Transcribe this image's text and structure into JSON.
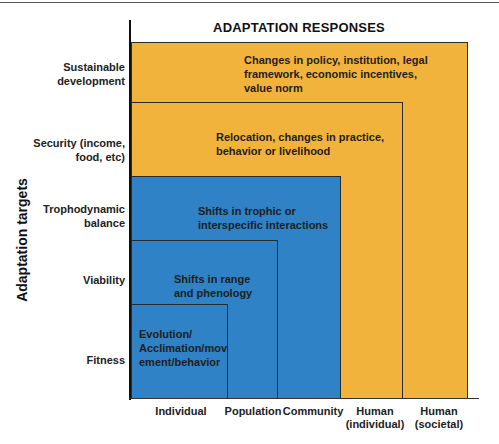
{
  "title": "ADAPTATION RESPONSES",
  "y_axis": {
    "title": "Adaptation targets",
    "labels": [
      {
        "line1": "Sustainable",
        "line2": "development"
      },
      {
        "line1": "Security (income,",
        "line2": "food, etc)"
      },
      {
        "line1": "Trophodynamic",
        "line2": "balance"
      },
      {
        "line1": "Viability",
        "line2": ""
      },
      {
        "line1": "Fitness",
        "line2": ""
      }
    ]
  },
  "x_axis": {
    "labels": [
      {
        "line1": "Individual",
        "line2": ""
      },
      {
        "line1": "Population",
        "line2": ""
      },
      {
        "line1": "Community",
        "line2": ""
      },
      {
        "line1": "Human",
        "line2": "(individual)"
      },
      {
        "line1": "Human",
        "line2": "(societal)"
      }
    ]
  },
  "boxes": [
    {
      "color": "#f2b33d",
      "lines": [
        "Changes in policy, institution, legal",
        "framework, economic incentives,",
        "value norm"
      ]
    },
    {
      "color": "#f2b33d",
      "lines": [
        "Relocation, changes in practice,",
        "behavior or livelihood"
      ]
    },
    {
      "color": "#2f82c5",
      "lines": [
        "Shifts in trophic or",
        "interspecific interactions"
      ]
    },
    {
      "color": "#2f82c5",
      "lines": [
        "Shifts in range",
        "and phenology"
      ]
    },
    {
      "color": "#2f82c5",
      "lines": [
        "Evolution/",
        "Acclimation/mov",
        "ement/behavior"
      ]
    }
  ],
  "colors": {
    "human_responses": "#f2b33d",
    "ecological_responses": "#2f82c5"
  }
}
